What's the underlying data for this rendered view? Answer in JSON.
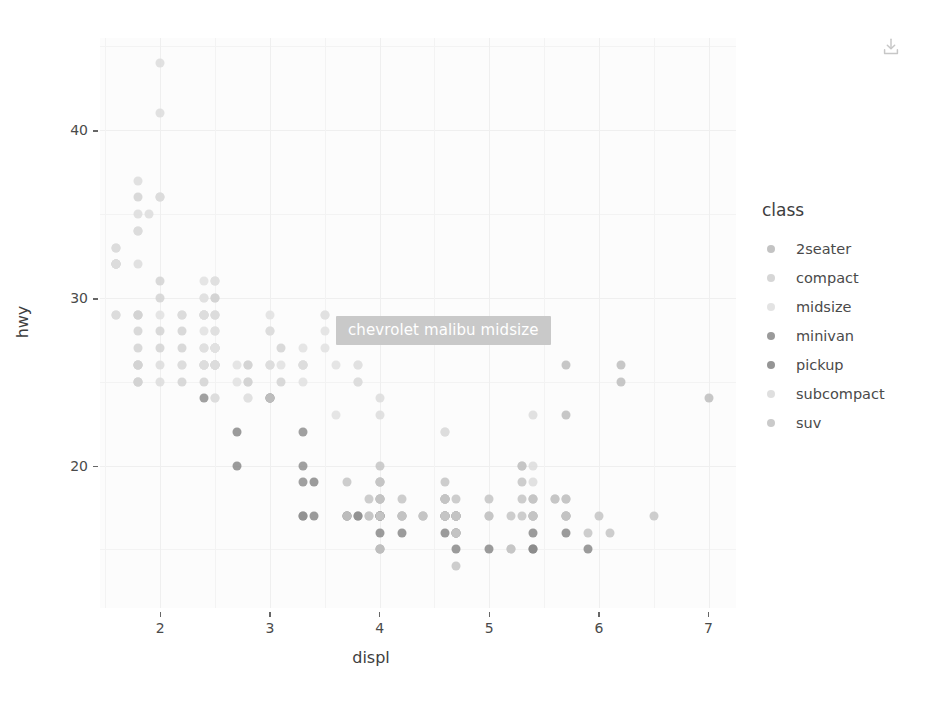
{
  "toolbar": {
    "download_icon": "download-icon"
  },
  "tooltip": {
    "text": "chevrolet malibu midsize",
    "bg": "#c9c9c9",
    "fg": "#ffffff"
  },
  "legend": {
    "title": "class",
    "items": [
      {
        "label": "2seater",
        "color": "#bdbdbd"
      },
      {
        "label": "compact",
        "color": "#d2d2d2"
      },
      {
        "label": "midsize",
        "color": "#e0e0e0"
      },
      {
        "label": "minivan",
        "color": "#8f8f8f"
      },
      {
        "label": "pickup",
        "color": "#8a8a8a"
      },
      {
        "label": "subcompact",
        "color": "#dcdcdc"
      },
      {
        "label": "suv",
        "color": "#c4c4c4"
      }
    ]
  },
  "chart_data": {
    "type": "scatter",
    "title": "",
    "xlabel": "displ",
    "ylabel": "hwy",
    "xlim": [
      1.45,
      7.25
    ],
    "ylim": [
      11.5,
      45.5
    ],
    "xticks": [
      "2",
      "3",
      "4",
      "5",
      "6",
      "7"
    ],
    "xtick_values": [
      2,
      3,
      4,
      5,
      6,
      7
    ],
    "yticks": [
      "20",
      "30",
      "40"
    ],
    "ytick_values": [
      20,
      30,
      40
    ],
    "grid": true,
    "legend_title": "class",
    "legend_position": "right",
    "color_by": "class",
    "series": [
      {
        "name": "2seater",
        "color": "#bdbdbd",
        "points": [
          [
            5.7,
            26
          ],
          [
            5.7,
            23
          ],
          [
            6.2,
            26
          ],
          [
            6.2,
            25
          ],
          [
            7.0,
            24
          ]
        ]
      },
      {
        "name": "compact",
        "color": "#d2d2d2",
        "points": [
          [
            1.8,
            29
          ],
          [
            1.8,
            29
          ],
          [
            2.0,
            31
          ],
          [
            2.0,
            30
          ],
          [
            2.8,
            26
          ],
          [
            2.8,
            26
          ],
          [
            3.1,
            27
          ],
          [
            1.8,
            26
          ],
          [
            1.8,
            25
          ],
          [
            2.0,
            28
          ],
          [
            2.0,
            27
          ],
          [
            2.8,
            25
          ],
          [
            2.8,
            25
          ],
          [
            3.1,
            25
          ],
          [
            1.6,
            33
          ],
          [
            1.6,
            32
          ],
          [
            1.6,
            32
          ],
          [
            1.6,
            29
          ],
          [
            1.6,
            32
          ],
          [
            1.8,
            34
          ],
          [
            1.8,
            36
          ],
          [
            2.0,
            36
          ],
          [
            2.4,
            29
          ],
          [
            2.4,
            26
          ],
          [
            2.5,
            28
          ],
          [
            2.5,
            27
          ],
          [
            2.2,
            27
          ],
          [
            2.2,
            25
          ],
          [
            2.4,
            27
          ],
          [
            2.4,
            25
          ],
          [
            2.4,
            26
          ],
          [
            2.4,
            29
          ],
          [
            2.5,
            30
          ],
          [
            2.5,
            31
          ],
          [
            2.5,
            26
          ],
          [
            2.5,
            26
          ],
          [
            2.5,
            27
          ],
          [
            2.5,
            30
          ],
          [
            2.2,
            29
          ],
          [
            2.2,
            28
          ],
          [
            3.3,
            26
          ],
          [
            1.8,
            26
          ],
          [
            1.8,
            25
          ],
          [
            1.8,
            26
          ],
          [
            1.8,
            28
          ],
          [
            1.8,
            27
          ],
          [
            1.8,
            25
          ],
          [
            1.8,
            26
          ],
          [
            1.8,
            29
          ]
        ]
      },
      {
        "name": "midsize",
        "color": "#e0e0e0",
        "points": [
          [
            2.4,
            31
          ],
          [
            2.4,
            30
          ],
          [
            3.1,
            26
          ],
          [
            3.5,
            28
          ],
          [
            2.4,
            27
          ],
          [
            2.4,
            26
          ],
          [
            3.0,
            29
          ],
          [
            3.3,
            27
          ],
          [
            2.4,
            30
          ],
          [
            2.4,
            29
          ],
          [
            3.0,
            26
          ],
          [
            3.5,
            29
          ],
          [
            3.0,
            28
          ],
          [
            3.5,
            27
          ],
          [
            2.4,
            29
          ],
          [
            2.4,
            28
          ],
          [
            3.3,
            26
          ],
          [
            3.8,
            26
          ],
          [
            3.8,
            26
          ],
          [
            2.5,
            27
          ],
          [
            2.5,
            27
          ],
          [
            3.3,
            26
          ],
          [
            3.8,
            25
          ],
          [
            2.7,
            26
          ],
          [
            2.7,
            25
          ],
          [
            3.0,
            26
          ],
          [
            3.5,
            29
          ],
          [
            3.6,
            26
          ],
          [
            2.5,
            29
          ],
          [
            2.5,
            27
          ],
          [
            2.5,
            31
          ],
          [
            2.2,
            26
          ],
          [
            2.4,
            26
          ],
          [
            3.3,
            25
          ],
          [
            2.0,
            29
          ],
          [
            2.5,
            28
          ],
          [
            2.5,
            27
          ],
          [
            2.8,
            24
          ],
          [
            2.8,
            24
          ],
          [
            3.6,
            23
          ],
          [
            2.5,
            24
          ]
        ]
      },
      {
        "name": "minivan",
        "color": "#8f8f8f",
        "points": [
          [
            2.4,
            24
          ],
          [
            3.0,
            24
          ],
          [
            3.3,
            22
          ],
          [
            3.3,
            19
          ],
          [
            3.3,
            20
          ],
          [
            3.3,
            17
          ],
          [
            3.3,
            17
          ],
          [
            3.8,
            17
          ],
          [
            3.8,
            17
          ],
          [
            4.0,
            17
          ],
          [
            3.0,
            24
          ]
        ]
      },
      {
        "name": "pickup",
        "color": "#8a8a8a",
        "points": [
          [
            2.7,
            20
          ],
          [
            2.7,
            22
          ],
          [
            3.4,
            17
          ],
          [
            3.4,
            19
          ],
          [
            4.0,
            17
          ],
          [
            4.7,
            15
          ],
          [
            4.7,
            17
          ],
          [
            4.7,
            17
          ],
          [
            5.7,
            16
          ],
          [
            5.7,
            17
          ],
          [
            3.7,
            17
          ],
          [
            3.7,
            17
          ],
          [
            4.0,
            15
          ],
          [
            4.0,
            16
          ],
          [
            4.0,
            17
          ],
          [
            4.6,
            17
          ],
          [
            5.4,
            16
          ],
          [
            5.4,
            15
          ],
          [
            4.0,
            18
          ],
          [
            4.0,
            17
          ],
          [
            4.6,
            17
          ],
          [
            5.0,
            15
          ],
          [
            4.2,
            17
          ],
          [
            4.2,
            16
          ],
          [
            4.6,
            16
          ],
          [
            4.6,
            17
          ],
          [
            4.6,
            18
          ],
          [
            5.4,
            15
          ],
          [
            5.4,
            17
          ],
          [
            5.9,
            15
          ],
          [
            4.7,
            16
          ],
          [
            4.7,
            16
          ],
          [
            4.7,
            17
          ]
        ]
      },
      {
        "name": "subcompact",
        "color": "#dcdcdc",
        "points": [
          [
            1.6,
            33
          ],
          [
            1.6,
            32
          ],
          [
            1.6,
            32
          ],
          [
            1.6,
            29
          ],
          [
            1.8,
            32
          ],
          [
            1.8,
            34
          ],
          [
            2.0,
            36
          ],
          [
            2.0,
            44
          ],
          [
            2.0,
            41
          ],
          [
            2.5,
            29
          ],
          [
            2.5,
            26
          ],
          [
            3.0,
            28
          ],
          [
            3.0,
            26
          ],
          [
            3.3,
            26
          ],
          [
            2.2,
            29
          ],
          [
            2.2,
            26
          ],
          [
            2.4,
            29
          ],
          [
            2.4,
            26
          ],
          [
            2.5,
            29
          ],
          [
            2.5,
            26
          ],
          [
            4.0,
            23
          ],
          [
            4.0,
            24
          ],
          [
            4.6,
            22
          ],
          [
            5.4,
            20
          ],
          [
            5.4,
            19
          ],
          [
            5.4,
            18
          ],
          [
            1.8,
            35
          ],
          [
            1.8,
            37
          ],
          [
            1.9,
            35
          ],
          [
            2.0,
            26
          ],
          [
            2.0,
            25
          ],
          [
            2.5,
            26
          ],
          [
            2.5,
            26
          ],
          [
            2.5,
            24
          ],
          [
            3.8,
            25
          ],
          [
            4.6,
            17
          ],
          [
            4.6,
            22
          ],
          [
            5.4,
            23
          ]
        ]
      },
      {
        "name": "suv",
        "color": "#c4c4c4",
        "points": [
          [
            3.0,
            24
          ],
          [
            3.7,
            19
          ],
          [
            3.7,
            17
          ],
          [
            3.9,
            17
          ],
          [
            3.9,
            17
          ],
          [
            4.7,
            17
          ],
          [
            4.7,
            17
          ],
          [
            4.7,
            16
          ],
          [
            4.7,
            16
          ],
          [
            5.2,
            15
          ],
          [
            5.2,
            15
          ],
          [
            3.9,
            18
          ],
          [
            4.7,
            18
          ],
          [
            4.7,
            17
          ],
          [
            4.7,
            17
          ],
          [
            5.2,
            17
          ],
          [
            5.7,
            17
          ],
          [
            5.9,
            16
          ],
          [
            4.0,
            19
          ],
          [
            4.0,
            18
          ],
          [
            4.0,
            20
          ],
          [
            4.6,
            18
          ],
          [
            5.0,
            17
          ],
          [
            4.2,
            17
          ],
          [
            4.4,
            17
          ],
          [
            4.6,
            18
          ],
          [
            5.4,
            17
          ],
          [
            5.4,
            18
          ],
          [
            4.0,
            17
          ],
          [
            4.0,
            19
          ],
          [
            4.6,
            17
          ],
          [
            5.0,
            17
          ],
          [
            4.0,
            19
          ],
          [
            4.0,
            18
          ],
          [
            4.6,
            19
          ],
          [
            5.0,
            18
          ],
          [
            5.3,
            20
          ],
          [
            5.3,
            19
          ],
          [
            5.3,
            20
          ],
          [
            5.7,
            18
          ],
          [
            6.0,
            17
          ],
          [
            5.3,
            18
          ],
          [
            5.3,
            17
          ],
          [
            5.7,
            17
          ],
          [
            6.5,
            17
          ],
          [
            5.6,
            18
          ],
          [
            5.6,
            18
          ],
          [
            5.7,
            18
          ],
          [
            6.1,
            16
          ],
          [
            4.0,
            17
          ],
          [
            4.2,
            18
          ],
          [
            4.4,
            17
          ],
          [
            4.6,
            17
          ],
          [
            5.4,
            17
          ],
          [
            5.4,
            18
          ],
          [
            4.6,
            18
          ],
          [
            5.4,
            17
          ],
          [
            4.0,
            15
          ],
          [
            4.7,
            14
          ],
          [
            4.2,
            17
          ],
          [
            4.4,
            17
          ],
          [
            4.6,
            18
          ]
        ]
      }
    ]
  }
}
